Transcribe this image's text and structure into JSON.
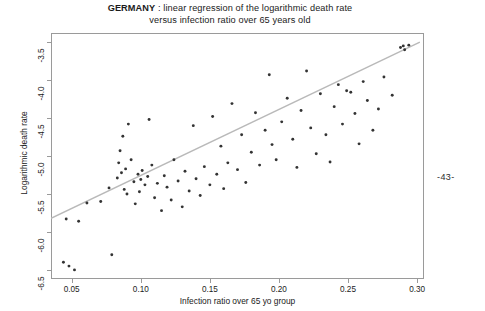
{
  "page": {
    "page_number": "-43-"
  },
  "chart_data": {
    "type": "scatter",
    "title_country": "GERMANY",
    "title_rest": " : linear regression of the logarithmic death rate",
    "title_line2": "versus infection ratio over 65 years old",
    "title": "GERMANY : linear regression of the logarithmic death rate versus infection ratio over 65 years old",
    "xlabel": "Infection ratio over 65 yo group",
    "ylabel": "Logarithmic death rate",
    "xlim": [
      0.035,
      0.305
    ],
    "ylim": [
      -6.62,
      -3.38
    ],
    "xticks": [
      0.05,
      0.1,
      0.15,
      0.2,
      0.25,
      0.3
    ],
    "xtick_labels": [
      "0.05",
      "0.10",
      "0.15",
      "0.20",
      "0.25",
      "0.30"
    ],
    "yticks": [
      -3.5,
      -4.0,
      -4.5,
      -5.0,
      -5.5,
      -6.0,
      -6.5
    ],
    "ytick_labels": [
      "-3.5",
      "-4.0",
      "-4.5",
      "-5.0",
      "-5.5",
      "-6.0",
      "-6.5"
    ],
    "grid": false,
    "legend": false,
    "point_color": "#333333",
    "line_color": "#b9b9b9",
    "frame_color": "#9a9a9a",
    "regression_line": {
      "name": "linear regression fit",
      "x_start": 0.035,
      "y_start": -5.82,
      "x_end": 0.302,
      "y_end": -3.5
    },
    "series": [
      {
        "name": "regions",
        "points": [
          [
            0.044,
            -6.4
          ],
          [
            0.048,
            -6.45
          ],
          [
            0.052,
            -6.5
          ],
          [
            0.046,
            -5.83
          ],
          [
            0.055,
            -5.86
          ],
          [
            0.061,
            -5.62
          ],
          [
            0.071,
            -5.6
          ],
          [
            0.077,
            -5.42
          ],
          [
            0.079,
            -6.3
          ],
          [
            0.083,
            -5.29
          ],
          [
            0.084,
            -5.09
          ],
          [
            0.085,
            -4.93
          ],
          [
            0.086,
            -5.22
          ],
          [
            0.087,
            -4.74
          ],
          [
            0.088,
            -5.44
          ],
          [
            0.089,
            -5.17
          ],
          [
            0.09,
            -5.5
          ],
          [
            0.091,
            -4.58
          ],
          [
            0.093,
            -5.05
          ],
          [
            0.095,
            -5.34
          ],
          [
            0.096,
            -5.63
          ],
          [
            0.098,
            -5.24
          ],
          [
            0.099,
            -5.47
          ],
          [
            0.1,
            -5.31
          ],
          [
            0.101,
            -5.19
          ],
          [
            0.103,
            -5.38
          ],
          [
            0.105,
            -5.27
          ],
          [
            0.106,
            -4.52
          ],
          [
            0.108,
            -5.12
          ],
          [
            0.11,
            -5.55
          ],
          [
            0.112,
            -5.36
          ],
          [
            0.115,
            -5.72
          ],
          [
            0.117,
            -5.26
          ],
          [
            0.119,
            -5.41
          ],
          [
            0.122,
            -5.58
          ],
          [
            0.124,
            -5.05
          ],
          [
            0.127,
            -5.33
          ],
          [
            0.13,
            -5.67
          ],
          [
            0.132,
            -5.2
          ],
          [
            0.135,
            -5.46
          ],
          [
            0.138,
            -4.6
          ],
          [
            0.14,
            -5.3
          ],
          [
            0.143,
            -5.52
          ],
          [
            0.146,
            -5.14
          ],
          [
            0.15,
            -5.38
          ],
          [
            0.152,
            -4.48
          ],
          [
            0.155,
            -5.24
          ],
          [
            0.158,
            -4.87
          ],
          [
            0.16,
            -5.43
          ],
          [
            0.163,
            -5.09
          ],
          [
            0.166,
            -4.31
          ],
          [
            0.17,
            -5.18
          ],
          [
            0.173,
            -4.72
          ],
          [
            0.176,
            -5.35
          ],
          [
            0.18,
            -4.95
          ],
          [
            0.183,
            -4.43
          ],
          [
            0.186,
            -5.12
          ],
          [
            0.19,
            -4.66
          ],
          [
            0.193,
            -3.93
          ],
          [
            0.195,
            -4.85
          ],
          [
            0.198,
            -5.05
          ],
          [
            0.202,
            -4.55
          ],
          [
            0.206,
            -4.24
          ],
          [
            0.21,
            -4.78
          ],
          [
            0.213,
            -5.15
          ],
          [
            0.216,
            -4.4
          ],
          [
            0.22,
            -3.88
          ],
          [
            0.223,
            -4.63
          ],
          [
            0.227,
            -4.97
          ],
          [
            0.23,
            -4.18
          ],
          [
            0.234,
            -4.72
          ],
          [
            0.237,
            -5.08
          ],
          [
            0.24,
            -4.35
          ],
          [
            0.243,
            -4.06
          ],
          [
            0.246,
            -4.58
          ],
          [
            0.249,
            -4.14
          ],
          [
            0.252,
            -4.16
          ],
          [
            0.255,
            -4.44
          ],
          [
            0.258,
            -4.84
          ],
          [
            0.261,
            -4.02
          ],
          [
            0.264,
            -4.27
          ],
          [
            0.268,
            -4.66
          ],
          [
            0.272,
            -4.38
          ],
          [
            0.276,
            -3.96
          ],
          [
            0.282,
            -4.2
          ],
          [
            0.288,
            -3.57
          ],
          [
            0.29,
            -3.55
          ],
          [
            0.291,
            -3.6
          ],
          [
            0.294,
            -3.54
          ]
        ]
      }
    ]
  }
}
